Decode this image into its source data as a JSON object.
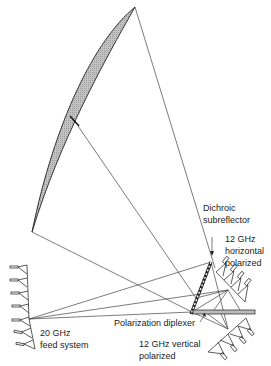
{
  "diagram": {
    "title": "",
    "labels": {
      "dichroic_line1": "Dichroic",
      "dichroic_line2": "subreflector",
      "horiz_line1": "12 GHz",
      "horiz_line2": "horizontal",
      "horiz_line3": "polarized",
      "diplexer": "Polarization diplexer",
      "feed20_line1": "20 GHz",
      "feed20_line2": "feed system",
      "vert_line1": "12 GHz vertical",
      "vert_line2": "polarized"
    },
    "components": [
      "main-reflector",
      "dichroic-subreflector",
      "polarization-diplexer",
      "20ghz-feed-array",
      "12ghz-horizontal-feed-array",
      "12ghz-vertical-feed-array"
    ],
    "colors": {
      "line": "#333333",
      "reflector_fill": "#b8b8b8",
      "background": "#ffffff"
    }
  }
}
